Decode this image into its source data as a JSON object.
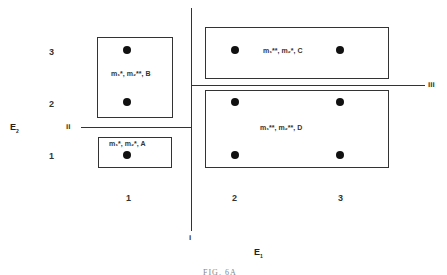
{
  "diagram": {
    "caption": "FIG. 6A",
    "axes": {
      "x": {
        "label": "E",
        "subscript": "1",
        "ticks": [
          "1",
          "2",
          "3"
        ]
      },
      "y": {
        "label": "E",
        "subscript": "2",
        "ticks": [
          "1",
          "2",
          "3"
        ]
      }
    },
    "dividers": [
      {
        "id": "i",
        "label": "i",
        "orientation": "vertical"
      },
      {
        "id": "ii",
        "label": "ii",
        "orientation": "horizontal"
      },
      {
        "id": "iii",
        "label": "iii",
        "orientation": "horizontal"
      }
    ],
    "regions": [
      {
        "id": "A",
        "label": "m₁*, m₂*, A",
        "points": [
          [
            1,
            1
          ]
        ]
      },
      {
        "id": "B",
        "label": "m₁*, m₂**, B",
        "points": [
          [
            1,
            2
          ],
          [
            1,
            3
          ]
        ]
      },
      {
        "id": "C",
        "label": "m₁**, m₂*, C",
        "points": [
          [
            2,
            3
          ],
          [
            3,
            3
          ]
        ]
      },
      {
        "id": "D",
        "label": "m₁**, m₂**, D",
        "points": [
          [
            2,
            1
          ],
          [
            3,
            1
          ],
          [
            2,
            2
          ],
          [
            3,
            2
          ]
        ]
      }
    ],
    "colors": {
      "line": "#333333",
      "dot": "#111111",
      "background": "#ffffff"
    }
  }
}
